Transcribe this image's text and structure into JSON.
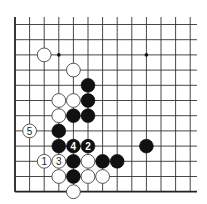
{
  "diagram": {
    "type": "go-board-problem",
    "board_section": "bottom-left corner",
    "grid": {
      "columns": 13,
      "rows": 12,
      "left_edge_visible": true,
      "bottom_edge_visible": true,
      "x0": 15,
      "dx": 14.6,
      "y0": 24.5,
      "dy": 15.2,
      "x_end": 197,
      "y_top": 17
    },
    "colors": {
      "black_stone": "#111111",
      "white_stone": "#ffffff",
      "line": "#333333",
      "background": "#ffffff"
    },
    "star_points": [
      {
        "col": 3,
        "row": 2
      },
      {
        "col": 9,
        "row": 2
      }
    ],
    "stones": [
      {
        "color": "white",
        "col": 2,
        "row": 2,
        "label": ""
      },
      {
        "color": "white",
        "col": 4,
        "row": 3,
        "label": ""
      },
      {
        "color": "black",
        "col": 5,
        "row": 4,
        "label": ""
      },
      {
        "color": "white",
        "col": 3,
        "row": 5,
        "label": ""
      },
      {
        "color": "white",
        "col": 4,
        "row": 5,
        "label": ""
      },
      {
        "color": "black",
        "col": 5,
        "row": 5,
        "label": ""
      },
      {
        "color": "white",
        "col": 3,
        "row": 6,
        "label": ""
      },
      {
        "color": "black",
        "col": 4,
        "row": 6,
        "label": ""
      },
      {
        "color": "black",
        "col": 5,
        "row": 6,
        "label": ""
      },
      {
        "color": "white",
        "col": 1,
        "row": 7,
        "label": "5"
      },
      {
        "color": "black",
        "col": 3,
        "row": 7,
        "label": ""
      },
      {
        "color": "black",
        "col": 3,
        "row": 8,
        "label": ""
      },
      {
        "color": "black",
        "col": 4,
        "row": 8,
        "label": "4"
      },
      {
        "color": "black",
        "col": 5,
        "row": 8,
        "label": "2"
      },
      {
        "color": "black",
        "col": 9,
        "row": 8,
        "label": ""
      },
      {
        "color": "white",
        "col": 2,
        "row": 9,
        "label": "1"
      },
      {
        "color": "white",
        "col": 3,
        "row": 9,
        "label": "3"
      },
      {
        "color": "black",
        "col": 4,
        "row": 9,
        "label": ""
      },
      {
        "color": "white",
        "col": 5,
        "row": 9,
        "label": ""
      },
      {
        "color": "black",
        "col": 6,
        "row": 9,
        "label": ""
      },
      {
        "color": "black",
        "col": 7,
        "row": 9,
        "label": ""
      },
      {
        "color": "white",
        "col": 3,
        "row": 10,
        "label": ""
      },
      {
        "color": "black",
        "col": 4,
        "row": 10,
        "label": ""
      },
      {
        "color": "white",
        "col": 5,
        "row": 10,
        "label": ""
      },
      {
        "color": "white",
        "col": 6,
        "row": 10,
        "label": ""
      },
      {
        "color": "white",
        "col": 4,
        "row": 11,
        "label": ""
      }
    ],
    "move_sequence": [
      {
        "move": "1",
        "color": "white"
      },
      {
        "move": "2",
        "color": "black"
      },
      {
        "move": "3",
        "color": "white"
      },
      {
        "move": "4",
        "color": "black"
      },
      {
        "move": "5",
        "color": "white"
      }
    ]
  }
}
